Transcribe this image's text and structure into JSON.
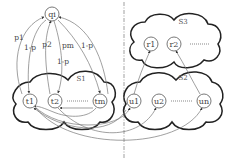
{
  "diagram": {
    "type": "cloud-node-graph",
    "hub_node": {
      "id": "qi",
      "label": "qi"
    },
    "clouds": [
      {
        "id": "S1",
        "label": "S1",
        "nodes": [
          "t1",
          "t2",
          "tm"
        ],
        "ellipsis": "-------"
      },
      {
        "id": "S2",
        "label": "S2",
        "nodes": [
          "u1",
          "u2",
          "un"
        ],
        "ellipsis": "-------"
      },
      {
        "id": "S3",
        "label": "S3",
        "nodes": [
          "r1",
          "r2"
        ],
        "ellipsis": "-------"
      }
    ],
    "nodes": {
      "qi": "qi",
      "t1": "t1",
      "t2": "t2",
      "tm": "tm",
      "u1": "u1",
      "u2": "u2",
      "un": "un",
      "r1": "r1",
      "r2": "r2"
    },
    "edge_labels": {
      "p1": "p1",
      "one_minus_p_a": "1-p",
      "p2": "p2",
      "one_minus_p_b": "1-p",
      "pm": "pm",
      "one_minus_p_c": "1-p"
    },
    "edges": [
      {
        "from": "t1",
        "to": "qi",
        "label": "p1"
      },
      {
        "from": "qi",
        "to": "t1",
        "label": "1-p"
      },
      {
        "from": "t2",
        "to": "qi",
        "label": "p2"
      },
      {
        "from": "qi",
        "to": "t2",
        "label": "1-p"
      },
      {
        "from": "tm",
        "to": "qi",
        "label": "pm"
      },
      {
        "from": "qi",
        "to": "tm",
        "label": "1-p"
      },
      {
        "from": "tm",
        "to": "t2",
        "label": ""
      },
      {
        "from": "tm",
        "to": "t1",
        "label": ""
      },
      {
        "from": "u1",
        "to": "r1",
        "label": ""
      },
      {
        "from": "un",
        "to": "r2",
        "label": ""
      },
      {
        "from": "t1",
        "to": "u1",
        "label": ""
      },
      {
        "from": "t2",
        "to": "u2",
        "label": ""
      },
      {
        "from": "tm",
        "to": "un",
        "label": ""
      },
      {
        "from": "u1",
        "to": "t1",
        "label": ""
      },
      {
        "from": "u2",
        "to": "t2",
        "label": ""
      }
    ],
    "divider": {
      "style": "dash-dot",
      "orientation": "vertical"
    }
  }
}
